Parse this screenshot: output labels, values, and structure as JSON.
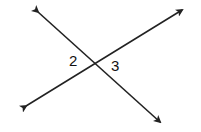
{
  "diagram": {
    "type": "intersecting-lines",
    "angle_labels": [
      "2",
      "3"
    ],
    "line_color": "#222222"
  }
}
